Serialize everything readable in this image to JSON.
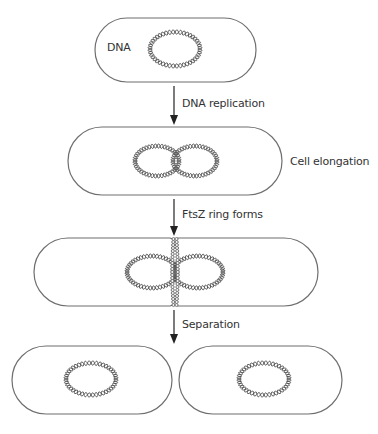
{
  "diagram": {
    "stages": [
      {
        "id": "initial-cell",
        "dna_label": "DNA"
      },
      {
        "id": "replicated-cell",
        "side_label": "Cell elongation"
      },
      {
        "id": "ftsz-cell"
      },
      {
        "id": "daughter-cells"
      }
    ],
    "steps": [
      {
        "label": "DNA replication"
      },
      {
        "label": "FtsZ ring forms"
      },
      {
        "label": "Separation"
      }
    ],
    "colors": {
      "outline": "#6f6f6f",
      "dna": "#555555",
      "arrow": "#222222",
      "text": "#333333"
    }
  }
}
